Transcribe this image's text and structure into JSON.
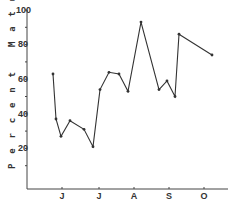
{
  "chart_data": {
    "type": "line",
    "title": "",
    "xlabel": "",
    "ylabel": "Percent Mature Females",
    "ylim": [
      0,
      100
    ],
    "yticks": [
      20,
      40,
      60,
      80,
      100
    ],
    "xtick_labels": [
      "J",
      "J",
      "A",
      "S",
      "O"
    ],
    "grid": false,
    "legend": null,
    "series": [
      {
        "name": "Percent Mature Females",
        "marker": "dot",
        "color": "#333333",
        "points": [
          {
            "x_px": 53,
            "y": 63
          },
          {
            "x_px": 56,
            "y": 37
          },
          {
            "x_px": 61,
            "y": 27
          },
          {
            "x_px": 70,
            "y": 36
          },
          {
            "x_px": 84,
            "y": 31
          },
          {
            "x_px": 93,
            "y": 21
          },
          {
            "x_px": 100,
            "y": 54
          },
          {
            "x_px": 109,
            "y": 64
          },
          {
            "x_px": 119,
            "y": 63
          },
          {
            "x_px": 128,
            "y": 53
          },
          {
            "x_px": 141,
            "y": 93
          },
          {
            "x_px": 159,
            "y": 54
          },
          {
            "x_px": 167,
            "y": 59
          },
          {
            "x_px": 175,
            "y": 50
          },
          {
            "x_px": 179,
            "y": 86
          },
          {
            "x_px": 212,
            "y": 74
          }
        ]
      }
    ]
  },
  "axis": {
    "ylabel": "P e r c e n t   M a t u r e   F e m a l e s",
    "yticks": [
      {
        "label": "100",
        "value": 100
      },
      {
        "label": "80",
        "value": 80
      },
      {
        "label": "60",
        "value": 60
      },
      {
        "label": "40",
        "value": 40
      },
      {
        "label": "20",
        "value": 20
      }
    ],
    "xticks": [
      {
        "label": "J",
        "x": 62
      },
      {
        "label": "J",
        "x": 99
      },
      {
        "label": "A",
        "x": 134
      },
      {
        "label": "S",
        "x": 169
      },
      {
        "label": "O",
        "x": 204
      }
    ]
  }
}
